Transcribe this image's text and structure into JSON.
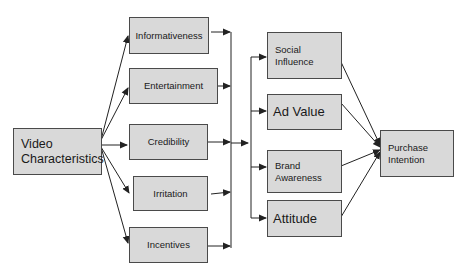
{
  "diagram": {
    "source": {
      "id": "video",
      "label": "Video\nCharacteristics"
    },
    "characteristics": [
      {
        "id": "informativeness",
        "label": "Informativeness"
      },
      {
        "id": "entertainment",
        "label": "Entertainment"
      },
      {
        "id": "credibility",
        "label": "Credibility"
      },
      {
        "id": "irritation",
        "label": "Irritation"
      },
      {
        "id": "incentives",
        "label": "Incentives"
      }
    ],
    "mediators": [
      {
        "id": "social-influence",
        "label": "Social\nInfluence"
      },
      {
        "id": "ad-value",
        "label": "Ad Value"
      },
      {
        "id": "brand-awareness",
        "label": "Brand\nAwareness"
      },
      {
        "id": "attitude",
        "label": "Attitude"
      }
    ],
    "outcome": {
      "id": "purchase-intention",
      "label": "Purchase\nIntention"
    },
    "colors": {
      "box_fill": "#d9d9d9",
      "box_border": "#4a4a4a",
      "line": "#222222",
      "background": "#ffffff"
    }
  }
}
